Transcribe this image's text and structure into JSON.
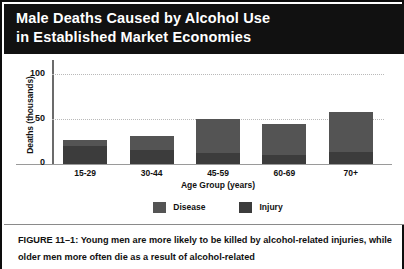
{
  "figure": {
    "banner_title": "Male Deaths Caused by Alcohol Use\nin Established Market Economies",
    "caption": "FIGURE 11–1: Young men are more likely to be killed by alcohol-related injuries, while older men more often die as a result of alcohol-related"
  },
  "colors": {
    "banner_background": "#111111",
    "banner_text": "#ffffff",
    "page_background": "#ffffff",
    "disease": "#545454",
    "injury": "#3c3c3c",
    "axis": "#6b6b6b",
    "gridline": "#b9b9b9",
    "text": "#111111"
  },
  "axes": {
    "y_title": "Deaths (thousands)",
    "y_ticks": [
      "100",
      "50",
      "0"
    ],
    "x_title": "Age Group (years)"
  },
  "legend": [
    {
      "label": "Disease",
      "swatch": "#545454"
    },
    {
      "label": "Injury",
      "swatch": "#3c3c3c"
    }
  ],
  "chart_data": {
    "type": "bar",
    "title": "Male Deaths Caused by Alcohol Use in Established Market Economies",
    "xlabel": "Age Group (years)",
    "ylabel": "Deaths (thousands)",
    "ylim": [
      0,
      110
    ],
    "yticks": [
      0,
      50,
      100
    ],
    "grid": "horizontal-dotted",
    "legend_position": "bottom-center",
    "stacked": true,
    "categories": [
      "15-29",
      "30-44",
      "45-59",
      "60-69",
      "70+"
    ],
    "series": [
      {
        "name": "Injury",
        "values": [
          23,
          18,
          14,
          11,
          15
        ]
      },
      {
        "name": "Disease",
        "values": [
          7,
          17,
          42,
          39,
          50
        ]
      }
    ],
    "totals": [
      30,
      35,
      56,
      50,
      65
    ]
  }
}
